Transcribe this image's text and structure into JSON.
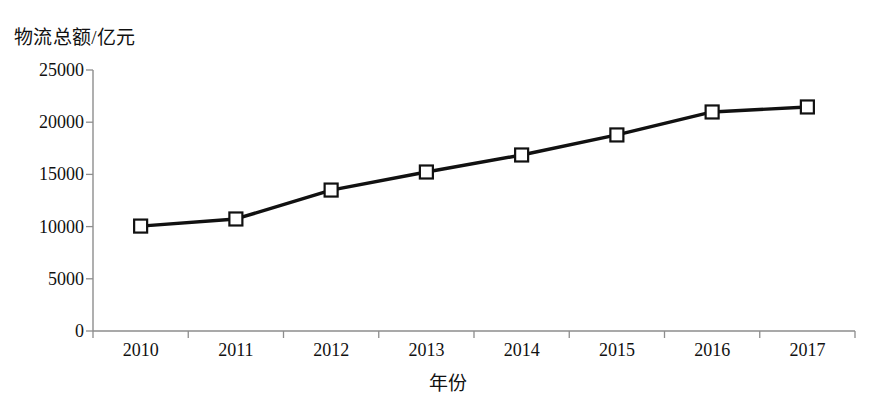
{
  "chart_data": {
    "type": "line",
    "title": "",
    "xlabel": "年份",
    "ylabel": "物流总额/亿元",
    "categories": [
      "2010",
      "2011",
      "2012",
      "2013",
      "2014",
      "2015",
      "2016",
      "2017"
    ],
    "values": [
      10050,
      10730,
      13500,
      15230,
      16860,
      18780,
      20980,
      21460
    ],
    "series": [
      {
        "name": "物流总额",
        "values": [
          10050,
          10730,
          13500,
          15230,
          16860,
          18780,
          20980,
          21460
        ]
      }
    ],
    "ylim": [
      0,
      25000
    ],
    "yticks": [
      "0",
      "5000",
      "10000",
      "15000",
      "20000",
      "25000"
    ],
    "ytick_values": [
      0,
      5000,
      10000,
      15000,
      20000,
      25000
    ],
    "grid": false,
    "legend": false,
    "legend_position": "none",
    "marker": "open-square",
    "line_color": "#111111",
    "marker_fill_color": "#ffffff",
    "axis_color": "#8d8d8d"
  }
}
